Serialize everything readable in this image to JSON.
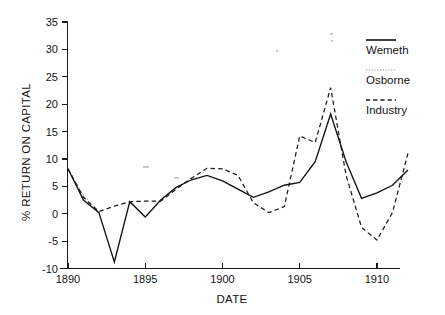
{
  "chart_data": {
    "type": "line",
    "title": "",
    "xlabel": "DATE",
    "ylabel": "% RETURN ON CAPITAL",
    "xlim": [
      1889,
      1912.4
    ],
    "ylim": [
      -10,
      35
    ],
    "grid": false,
    "legend_position": "right",
    "x_ticks": [
      "1890",
      "1895",
      "1900",
      "1905",
      "1910"
    ],
    "x_tick_values": [
      1890,
      1895,
      1900,
      1905,
      1910
    ],
    "y_ticks": [
      "35",
      "30",
      "25",
      "20",
      "15",
      "10",
      "5",
      "0",
      "-5",
      "-10"
    ],
    "y_tick_values": [
      35,
      30,
      25,
      20,
      15,
      10,
      5,
      0,
      -5,
      -10
    ],
    "x": [
      1890,
      1891,
      1892,
      1893,
      1894,
      1895,
      1896,
      1897,
      1898,
      1899,
      1900,
      1901,
      1902,
      1903,
      1904,
      1905,
      1906,
      1907,
      1908,
      1909,
      1910,
      1911,
      1912
    ],
    "series": [
      {
        "name": "Wemeth",
        "style": "solid",
        "color": "#121212",
        "values": [
          8.2,
          2.5,
          0.2,
          -8.8,
          2.2,
          -0.6,
          2.5,
          4.8,
          6.2,
          7.0,
          6.0,
          4.5,
          3.0,
          4.0,
          5.2,
          5.7,
          9.5,
          18.2,
          9.5,
          2.8,
          3.8,
          5.2,
          8.0
        ]
      },
      {
        "name": "Osborne",
        "style": "dotted",
        "color": "#9a9a9a",
        "values": [
          8.2,
          3.4,
          0.3,
          null,
          null,
          null,
          null,
          null,
          null,
          null,
          null,
          null,
          null,
          null,
          null,
          null,
          null,
          null,
          null,
          null,
          null,
          null,
          null
        ]
      },
      {
        "name": "Industry",
        "style": "dashed",
        "color": "#1c1c1c",
        "values": [
          8.2,
          3.0,
          0.4,
          1.4,
          2.2,
          2.3,
          2.3,
          4.5,
          6.5,
          8.3,
          8.2,
          7.0,
          2.0,
          0.2,
          1.3,
          14.2,
          13.0,
          23.0,
          7.0,
          -2.5,
          -4.8,
          0.2,
          11.0
        ]
      }
    ]
  },
  "legend": {
    "entries": [
      {
        "label": "Wemeth",
        "style": "solid"
      },
      {
        "label": "Osborne",
        "style": "dotted"
      },
      {
        "label": "Industry",
        "style": "dashed"
      }
    ]
  },
  "axes": {
    "x_title": "DATE",
    "y_title": "% RETURN ON CAPITAL"
  }
}
